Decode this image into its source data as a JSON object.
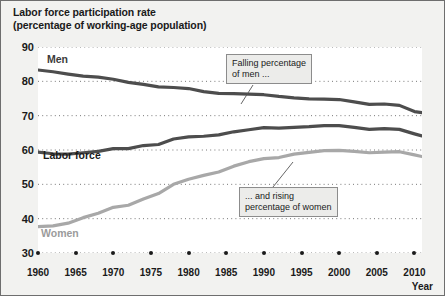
{
  "chart_data": {
    "type": "line",
    "title": "Labor force participation rate",
    "subtitle": "(percentage of working-age population)",
    "xlabel": "Year",
    "ylabel": "",
    "xlim": [
      1960,
      2011
    ],
    "ylim": [
      30,
      90
    ],
    "ytick_labels": [
      "30",
      "40",
      "50",
      "60",
      "70",
      "80",
      "90"
    ],
    "yticks": [
      30,
      40,
      50,
      60,
      70,
      80,
      90
    ],
    "xtick_labels": [
      "1960",
      "1965",
      "1970",
      "1975",
      "1980",
      "1985",
      "1990",
      "1995",
      "2000",
      "2005",
      "2010"
    ],
    "xticks": [
      1960,
      1965,
      1970,
      1975,
      1980,
      1985,
      1990,
      1995,
      2000,
      2005,
      2010
    ],
    "grid": "dotted-horizontal",
    "legend_position": "inline-labels",
    "series": [
      {
        "name": "Men",
        "color": "#4d4d4d",
        "x": [
          1960,
          1962,
          1964,
          1966,
          1968,
          1970,
          1972,
          1974,
          1976,
          1978,
          1980,
          1982,
          1984,
          1986,
          1988,
          1990,
          1992,
          1994,
          1996,
          1998,
          2000,
          2002,
          2004,
          2006,
          2008,
          2010,
          2011
        ],
        "values": [
          83.3,
          82.8,
          82.1,
          81.5,
          81.2,
          80.6,
          79.7,
          79.1,
          78.4,
          78.2,
          77.9,
          77.0,
          76.5,
          76.4,
          76.3,
          76.1,
          75.6,
          75.2,
          74.9,
          74.8,
          74.7,
          74.0,
          73.3,
          73.4,
          73.0,
          71.2,
          70.9
        ]
      },
      {
        "name": "Labor force",
        "color": "#4d4d4d",
        "x": [
          1960,
          1962,
          1964,
          1966,
          1968,
          1970,
          1972,
          1974,
          1976,
          1978,
          1980,
          1982,
          1984,
          1986,
          1988,
          1990,
          1992,
          1994,
          1996,
          1998,
          2000,
          2002,
          2004,
          2006,
          2008,
          2010,
          2011
        ],
        "values": [
          59.4,
          58.9,
          58.8,
          59.2,
          59.6,
          60.4,
          60.4,
          61.3,
          61.6,
          63.2,
          63.8,
          64.0,
          64.4,
          65.3,
          65.9,
          66.5,
          66.4,
          66.6,
          66.8,
          67.1,
          67.1,
          66.6,
          66.0,
          66.2,
          66.0,
          64.7,
          64.1
        ]
      },
      {
        "name": "Women",
        "color": "#a8a8a8",
        "x": [
          1960,
          1962,
          1964,
          1966,
          1968,
          1970,
          1972,
          1974,
          1976,
          1978,
          1980,
          1982,
          1984,
          1986,
          1988,
          1990,
          1992,
          1994,
          1996,
          1998,
          2000,
          2002,
          2004,
          2006,
          2008,
          2010,
          2011
        ],
        "values": [
          37.7,
          37.9,
          38.7,
          40.3,
          41.6,
          43.3,
          43.9,
          45.7,
          47.3,
          50.0,
          51.5,
          52.6,
          53.6,
          55.3,
          56.6,
          57.5,
          57.8,
          58.8,
          59.3,
          59.8,
          59.9,
          59.6,
          59.2,
          59.4,
          59.5,
          58.6,
          58.1
        ]
      }
    ],
    "annotations": [
      {
        "id": "men-note",
        "line1": "Falling percentage",
        "line2": "of men ..."
      },
      {
        "id": "women-note",
        "line1": "... and rising",
        "line2": "percentage of women"
      }
    ]
  }
}
